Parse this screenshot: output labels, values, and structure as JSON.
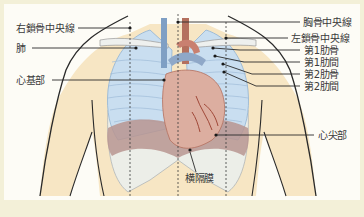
{
  "figure": {
    "colors": {
      "frame": "#f3f0d8",
      "background": "#fdfcf6",
      "skin": "#f7e6c4",
      "lung": "#c9def0",
      "lung_edge": "#8fb3d4",
      "heart": "#dcaea0",
      "heart_dark": "#b4705e",
      "vessel_blue": "#7f9fc4",
      "diaphragm": "#b99590",
      "rib": "#eef2f6",
      "outline": "#2a2a2a",
      "leader": "#2a2a2a",
      "label_text": "#3a3a3a"
    },
    "reference_lines": [
      {
        "name": "right-midclavicular-line",
        "x": 130
      },
      {
        "name": "midsternal-line",
        "x": 178
      },
      {
        "name": "left-midclavicular-line",
        "x": 226
      }
    ]
  },
  "labels": {
    "left": [
      {
        "id": "right_midclavicular",
        "text": "右鎖骨中央線"
      },
      {
        "id": "lung",
        "text": "肺"
      },
      {
        "id": "heart_base",
        "text": "心基部"
      }
    ],
    "right": [
      {
        "id": "midsternal",
        "text": "胸骨中央線"
      },
      {
        "id": "left_midclavicular",
        "text": "左鎖骨中央線"
      },
      {
        "id": "rib1",
        "text": "第1肋骨"
      },
      {
        "id": "ics1",
        "text": "第1肋間"
      },
      {
        "id": "rib2",
        "text": "第2肋骨"
      },
      {
        "id": "ics2",
        "text": "第2肋間"
      },
      {
        "id": "apex",
        "text": "心尖部"
      }
    ],
    "bottom": [
      {
        "id": "diaphragm",
        "text": "横隔膜"
      }
    ]
  }
}
